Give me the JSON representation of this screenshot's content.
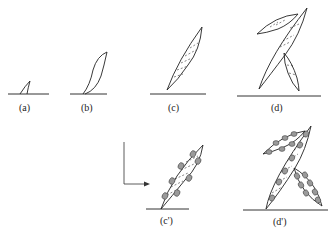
{
  "figure": {
    "panels": [
      {
        "id": "a",
        "label": "(a)"
      },
      {
        "id": "b",
        "label": "(b)"
      },
      {
        "id": "c",
        "label": "(c)"
      },
      {
        "id": "d",
        "label": "(d)"
      },
      {
        "id": "c_prime",
        "label": "(c')"
      },
      {
        "id": "d_prime",
        "label": "(d')"
      }
    ],
    "colors": {
      "line": "#222222",
      "cell_fill": "#9a9a9a",
      "background": "#ffffff"
    }
  }
}
